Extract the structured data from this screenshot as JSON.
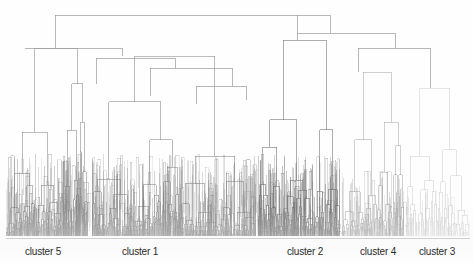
{
  "figure": {
    "title": "",
    "width": 473,
    "height": 266,
    "background_color": "#fefefe",
    "line_color": "#8d8d8d",
    "label_color": "#2b2b2b",
    "baseline_color": "#8a8a8a"
  },
  "axis": {
    "baseline_y": 238,
    "root_y": 15,
    "leaf_bottom_y": 236
  },
  "labels": [
    {
      "text": "cluster 5",
      "x": 43,
      "y": 246
    },
    {
      "text": "cluster 1",
      "x": 140,
      "y": 246
    },
    {
      "text": "cluster 2",
      "x": 305,
      "y": 246
    },
    {
      "text": "cluster 4",
      "x": 378,
      "y": 246
    },
    {
      "text": "cluster 3",
      "x": 437,
      "y": 246
    }
  ],
  "chart_data": {
    "type": "dendrogram",
    "title": "",
    "xlabel": "",
    "ylabel": "",
    "orientation": "top-down",
    "n_clusters": 5,
    "cluster_names": [
      "cluster 5",
      "cluster 1",
      "cluster 2",
      "cluster 4",
      "cluster 3"
    ],
    "xlim": [
      0,
      473
    ],
    "ylim": [
      238,
      15
    ],
    "grid": false,
    "legend": "none",
    "clusters": [
      {
        "name": "cluster 5",
        "x_start": 6,
        "x_end": 88,
        "label_x": 43,
        "merge_height_y": 48,
        "density": "high",
        "shade": "dark"
      },
      {
        "name": "cluster 1",
        "x_start": 92,
        "x_end": 256,
        "label_x": 140,
        "merge_height_y": 56,
        "density": "high",
        "shade": "dark"
      },
      {
        "name": "cluster 2",
        "x_start": 258,
        "x_end": 340,
        "label_x": 305,
        "merge_height_y": 40,
        "density": "high",
        "shade": "darkest"
      },
      {
        "name": "cluster 4",
        "x_start": 342,
        "x_end": 404,
        "label_x": 378,
        "merge_height_y": 72,
        "density": "medium",
        "shade": "medium"
      },
      {
        "name": "cluster 3",
        "x_start": 406,
        "x_end": 470,
        "label_x": 437,
        "merge_height_y": 88,
        "density": "low",
        "shade": "light"
      }
    ],
    "root_links": [
      {
        "id": "root",
        "y": 15,
        "x_left": 55,
        "x_right": 330,
        "children": [
          "A",
          "B"
        ]
      },
      {
        "id": "A",
        "y": 48,
        "x_left": 25,
        "x_right": 122,
        "children": [
          "A1",
          "A2"
        ]
      },
      {
        "id": "B",
        "y": 48,
        "x_left": 358,
        "x_right": 430,
        "children": [
          "B1",
          "B2"
        ]
      },
      {
        "id": "A2",
        "y": 58,
        "x_left": 96,
        "x_right": 175,
        "children": [
          "A2a",
          "A2b"
        ]
      },
      {
        "id": "A2b",
        "y": 68,
        "x_left": 150,
        "x_right": 232,
        "children": [
          "A2b1",
          "A2b2"
        ]
      }
    ]
  }
}
